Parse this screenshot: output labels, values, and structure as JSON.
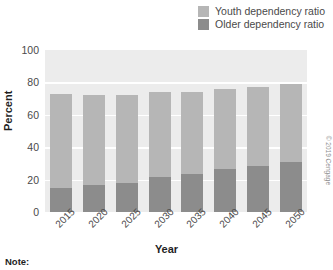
{
  "legend": {
    "items": [
      {
        "label": "Youth dependency ratio",
        "color": "#b6b6b6",
        "name": "youth-dependency-ratio"
      },
      {
        "label": "Older dependency ratio",
        "color": "#8c8c8c",
        "name": "older-dependency-ratio"
      }
    ]
  },
  "axes": {
    "y_title": "Percent",
    "x_title": "Year",
    "y_ticks": [
      "0",
      "20",
      "40",
      "60",
      "80",
      "100"
    ]
  },
  "note": {
    "label": "Note:"
  },
  "credit": {
    "text": "© 2019 Cengage"
  },
  "colors": {
    "youth": "#b6b6b6",
    "older": "#8c8c8c",
    "plot_background": "#ececec",
    "gridline": "#ffffff",
    "text": "#4a4a4a"
  },
  "chart_data": {
    "type": "bar",
    "subtype": "stacked-bar",
    "title": "",
    "xlabel": "Year",
    "ylabel": "Percent",
    "ylim": [
      0,
      100
    ],
    "ytick_step": 20,
    "grid": true,
    "legend_position": "top-right",
    "categories": [
      "2015",
      "2020",
      "2025",
      "2030",
      "2035",
      "2040",
      "2045",
      "2050"
    ],
    "series": [
      {
        "name": "Older dependency ratio",
        "color": "#8c8c8c",
        "values": [
          15,
          16.5,
          18,
          21.5,
          23.5,
          26.5,
          28.5,
          31
        ]
      },
      {
        "name": "Youth dependency ratio",
        "color": "#b6b6b6",
        "values": [
          58,
          55.5,
          54,
          52.5,
          50.5,
          49.5,
          48.5,
          48
        ]
      }
    ],
    "totals": [
      73,
      72,
      72,
      74,
      74,
      76,
      77,
      79
    ]
  }
}
